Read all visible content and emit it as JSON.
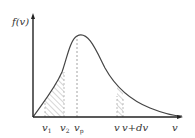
{
  "diagram": {
    "y_axis_label": "f(v)",
    "x_axis_label": "v",
    "tick_labels": {
      "v1": "v",
      "v1_sub": "1",
      "v2": "v",
      "v2_sub": "2",
      "vp": "v",
      "vp_sub": "p",
      "v": "v",
      "vdv": "v+dv"
    },
    "colors": {
      "curve": "#444444",
      "axis": "#222222",
      "hatch": "#888888",
      "dashed": "#999999"
    }
  }
}
